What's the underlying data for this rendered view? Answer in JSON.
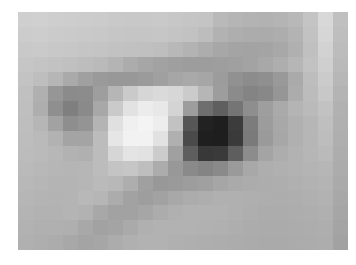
{
  "image": {
    "subject": "human-eye",
    "style": "pixelated-mosaic-grayscale",
    "colorspace": "grayscale",
    "canvas": {
      "width": 356,
      "height": 265,
      "background": "#ffffff"
    },
    "content_box": {
      "x": 18,
      "y": 12,
      "width": 330,
      "height": 238
    },
    "mosaic": {
      "columns": 22,
      "rows": 16,
      "block_width": 15,
      "block_height": 14.875
    },
    "tone_range": {
      "darkest": "#1e1e1e",
      "brightest": "#f4f4f4",
      "mid": "#b0b0b0"
    },
    "features": [
      {
        "name": "pupil",
        "tone": "#1e1e1e",
        "block_col_range": [
          10,
          12
        ],
        "block_row_range": [
          6,
          8
        ]
      },
      {
        "name": "iris",
        "tone": "#6e6e6e",
        "block_col_range": [
          9,
          14
        ],
        "block_row_range": [
          5,
          9
        ]
      },
      {
        "name": "sclera-highlight",
        "tone": "#f2f2f2",
        "block_col_range": [
          6,
          9
        ],
        "block_row_range": [
          7,
          8
        ]
      },
      {
        "name": "upper-eyelid-crease",
        "tone": "#8f8f8f",
        "block_col_range": [
          1,
          16
        ],
        "block_row_range": [
          3,
          4
        ]
      },
      {
        "name": "lower-eyelid",
        "tone": "#9d9d9d",
        "block_col_range": [
          3,
          17
        ],
        "block_row_range": [
          10,
          12
        ]
      },
      {
        "name": "brow-shadow",
        "tone": "#8a8a8a",
        "block_col_range": [
          13,
          18
        ],
        "block_row_range": [
          2,
          5
        ]
      }
    ],
    "grid": [
      [
        "#cfcfcf",
        "#d0d0d0",
        "#cecece",
        "#cdcdcd",
        "#cccccc",
        "#cbcbcb",
        "#c9c9c9",
        "#c8c8c8",
        "#c8c8c8",
        "#c9c9c9",
        "#c7c7c7",
        "#c5c5c5",
        "#c4c4c4",
        "#b9b9b9",
        "#b5b5b5",
        "#b3b3b3",
        "#b2b2b2",
        "#b4b4b4",
        "#b8b8b8",
        "#c4c4c4",
        "#d8d8d8",
        "#c0c0c0"
      ],
      [
        "#cccccc",
        "#cdcdcd",
        "#cbcbcb",
        "#cacaca",
        "#c9c9c9",
        "#c8c8c8",
        "#c6c6c6",
        "#c5c5c5",
        "#c5c5c5",
        "#c6c6c6",
        "#c4c4c4",
        "#c2c2c2",
        "#bdbdbd",
        "#b2b2b2",
        "#aeaeae",
        "#acacac",
        "#ababab",
        "#adadad",
        "#b3b3b3",
        "#c2c2c2",
        "#d6d6d6",
        "#bebebe"
      ],
      [
        "#c9c9c9",
        "#cacaca",
        "#c8c8c8",
        "#c7c7c7",
        "#c5c5c5",
        "#c4c4c4",
        "#c2c2c2",
        "#c1c1c1",
        "#c0c0c0",
        "#bebebe",
        "#b8b8b8",
        "#b3b3b3",
        "#adadad",
        "#a7a7a7",
        "#a4a4a4",
        "#a3a3a3",
        "#a4a4a4",
        "#a8a8a8",
        "#b0b0b0",
        "#c0c0c0",
        "#d2d2d2",
        "#bcbcbc"
      ],
      [
        "#c6c6c6",
        "#c4c4c4",
        "#c2c2c2",
        "#c0c0c0",
        "#bdbdbd",
        "#bababa",
        "#b4b4b4",
        "#acacac",
        "#a6a6a6",
        "#a2a2a2",
        "#9f9f9f",
        "#9d9d9d",
        "#9d9d9d",
        "#9e9e9e",
        "#a0a0a0",
        "#a3a3a3",
        "#a8a8a8",
        "#aeaeae",
        "#b6b6b6",
        "#c2c2c2",
        "#cfcfcf",
        "#bababa"
      ],
      [
        "#c3c3c3",
        "#bebebe",
        "#b6b6b6",
        "#aaaaaa",
        "#a0a0a0",
        "#9a9a9a",
        "#989898",
        "#989898",
        "#9b9b9b",
        "#a0a0a0",
        "#a6a6a6",
        "#a9a9a9",
        "#a6a6a6",
        "#9c9c9c",
        "#919191",
        "#8c8c8c",
        "#8f8f8f",
        "#999999",
        "#aaaaaa",
        "#bdbdbd",
        "#cbcbcb",
        "#b7b7b7"
      ],
      [
        "#c0c0c0",
        "#b0b0b0",
        "#969696",
        "#8b8b8b",
        "#8c8c8c",
        "#9e9e9e",
        "#b6b6b6",
        "#cacaca",
        "#d6d6d6",
        "#dadada",
        "#d7d7d7",
        "#cbcbcb",
        "#b6b6b6",
        "#9d9d9d",
        "#8b8b8b",
        "#848484",
        "#888888",
        "#969696",
        "#acacac",
        "#bcbcbc",
        "#c8c8c8",
        "#b4b4b4"
      ],
      [
        "#bfbfbf",
        "#aeaeae",
        "#8f8f8f",
        "#7f7f7f",
        "#8a8a8a",
        "#a8a8a8",
        "#cacaca",
        "#e2e2e2",
        "#ececec",
        "#e8e8e8",
        "#d4d4d4",
        "#9d9d9d",
        "#6e6e6e",
        "#5f5f5f",
        "#757575",
        "#8e8e8e",
        "#9e9e9e",
        "#aaaaaa",
        "#b4b4b4",
        "#bababa",
        "#c2c2c2",
        "#b1b1b1"
      ],
      [
        "#bebebe",
        "#b6b6b6",
        "#a2a2a2",
        "#8e8e8e",
        "#949494",
        "#b4b4b4",
        "#e0e0e0",
        "#f0f0f0",
        "#f4f4f4",
        "#ededed",
        "#c2c2c2",
        "#565656",
        "#222222",
        "#1e1e1e",
        "#3c3c3c",
        "#7c7c7c",
        "#9c9c9c",
        "#a8a8a8",
        "#b0b0b0",
        "#b6b6b6",
        "#bfbfbf",
        "#b0b0b0"
      ],
      [
        "#bdbdbd",
        "#bababa",
        "#b2b2b2",
        "#a4a4a4",
        "#a4a4a4",
        "#bcbcbc",
        "#e6e6e6",
        "#f2f2f2",
        "#f2f2f2",
        "#e2e2e2",
        "#b0b0b0",
        "#4a4a4a",
        "#1f1f1f",
        "#1e1e1e",
        "#3a3a3a",
        "#7a7a7a",
        "#9a9a9a",
        "#a7a7a7",
        "#b0b0b0",
        "#b6b6b6",
        "#bdbdbd",
        "#afafaf"
      ],
      [
        "#bcbcbc",
        "#bababa",
        "#b7b7b7",
        "#b2b2b2",
        "#b0b0b0",
        "#bcbcbc",
        "#d6d6d6",
        "#e4e4e4",
        "#e2e2e2",
        "#cccccc",
        "#a0a0a0",
        "#5e5e5e",
        "#383838",
        "#3a3a3a",
        "#5e5e5e",
        "#8c8c8c",
        "#a4a4a4",
        "#adadad",
        "#b2b2b2",
        "#b6b6b6",
        "#bababa",
        "#adadad"
      ],
      [
        "#bababa",
        "#b8b8b8",
        "#b6b6b6",
        "#b5b5b5",
        "#b6b6b6",
        "#bcbcbc",
        "#c4c4c4",
        "#c6c6c6",
        "#bebebe",
        "#acacac",
        "#989898",
        "#8a8a8a",
        "#848484",
        "#8a8a8a",
        "#9a9a9a",
        "#a8a8a8",
        "#aeaeae",
        "#b0b0b0",
        "#b2b2b2",
        "#b4b4b4",
        "#b6b6b6",
        "#acacac"
      ],
      [
        "#b8b8b8",
        "#b6b6b6",
        "#b4b4b4",
        "#b4b4b4",
        "#b6b6b6",
        "#bababa",
        "#b8b8b8",
        "#aeaeae",
        "#a0a0a0",
        "#989898",
        "#9a9a9a",
        "#9d9d9d",
        "#a0a0a0",
        "#a6a6a6",
        "#aaaaaa",
        "#acacac",
        "#adadad",
        "#aeaeae",
        "#b0b0b0",
        "#b2b2b2",
        "#b4b4b4",
        "#aaaaaa"
      ],
      [
        "#b6b6b6",
        "#b4b4b4",
        "#b3b3b3",
        "#b4b4b4",
        "#b8b8b8",
        "#b6b6b6",
        "#acacac",
        "#a2a2a2",
        "#9e9e9e",
        "#a2a2a2",
        "#a8a8a8",
        "#acacac",
        "#aeaeae",
        "#b0b0b0",
        "#b0b0b0",
        "#afafaf",
        "#aeaeae",
        "#adadad",
        "#aeaeae",
        "#b0b0b0",
        "#b2b2b2",
        "#a8a8a8"
      ],
      [
        "#b4b4b4",
        "#b2b2b2",
        "#b2b2b2",
        "#b4b4b4",
        "#b2b2b2",
        "#a8a8a8",
        "#a2a2a2",
        "#a2a2a2",
        "#a6a6a6",
        "#acacac",
        "#b0b0b0",
        "#b2b2b2",
        "#b2b2b2",
        "#b2b2b2",
        "#b0b0b0",
        "#aeaeae",
        "#acacac",
        "#acacac",
        "#adadad",
        "#aeaeae",
        "#b0b0b0",
        "#a6a6a6"
      ],
      [
        "#b2b2b2",
        "#b0b0b0",
        "#b0b0b0",
        "#afafaf",
        "#a8a8a8",
        "#a2a2a2",
        "#a4a4a4",
        "#aaaaaa",
        "#b0b0b0",
        "#b2b2b2",
        "#b2b2b2",
        "#b2b2b2",
        "#b1b1b1",
        "#b0b0b0",
        "#aeaeae",
        "#acacac",
        "#ababab",
        "#ababab",
        "#acacac",
        "#adadad",
        "#aeaeae",
        "#a4a4a4"
      ],
      [
        "#b0b0b0",
        "#aeaeae",
        "#acacac",
        "#a8a8a8",
        "#a4a4a4",
        "#a6a6a6",
        "#acacac",
        "#b0b0b0",
        "#b2b2b2",
        "#b2b2b2",
        "#b0b0b0",
        "#afafaf",
        "#aeaeae",
        "#adadad",
        "#acacac",
        "#ababab",
        "#aaaaaa",
        "#aaaaaa",
        "#ababab",
        "#acacac",
        "#adadad",
        "#a2a2a2"
      ]
    ]
  }
}
